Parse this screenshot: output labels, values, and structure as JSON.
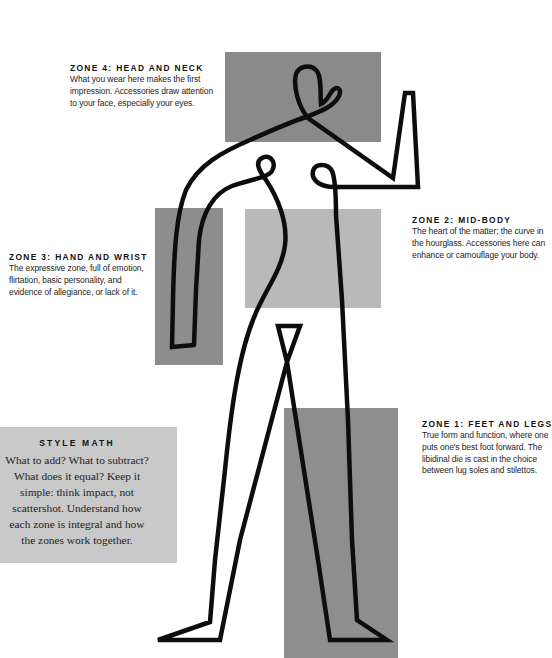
{
  "zones": {
    "zone_4": {
      "heading": "ZONE 4: HEAD AND NECK",
      "lines": [
        "What you wear here makes the first",
        "impression. Accessories draw attention",
        "to your face, especially your eyes."
      ]
    },
    "zone_3": {
      "heading": "ZONE 3: HAND AND WRIST",
      "lines": [
        "The expressive zone, full of emotion,",
        "flirtation, basic personality, and",
        "evidence of allegiance, or lack of it."
      ]
    },
    "zone_2": {
      "heading": "ZONE 2: MID-BODY",
      "lines": [
        "The heart of the matter; the curve in",
        "the hourglass. Accessories here can",
        "enhance or camouflage your body."
      ]
    },
    "zone_1": {
      "heading": "ZONE 1: FEET AND LEGS",
      "lines": [
        "True form and function, where one",
        "puts one's best foot forward. The",
        "libidinal die is cast in the choice",
        "between lug soles and stilettos."
      ]
    }
  },
  "style_math": {
    "heading": "STYLE MATH",
    "lines": [
      "What to add? What to subtract?",
      "What does it equal? Keep it",
      "simple: think impact, not",
      "scattershot. Understand how",
      "each zone is integral and how",
      "the zones work together."
    ]
  },
  "colors": {
    "head_rect": "#8a8a8a",
    "hand_rect": "#8d8d8d",
    "mid_rect": "#b9b9b9",
    "feet_rect": "#8e8e8e",
    "style_math_box": "#c9c9c9",
    "line": "#0d0d0d"
  }
}
